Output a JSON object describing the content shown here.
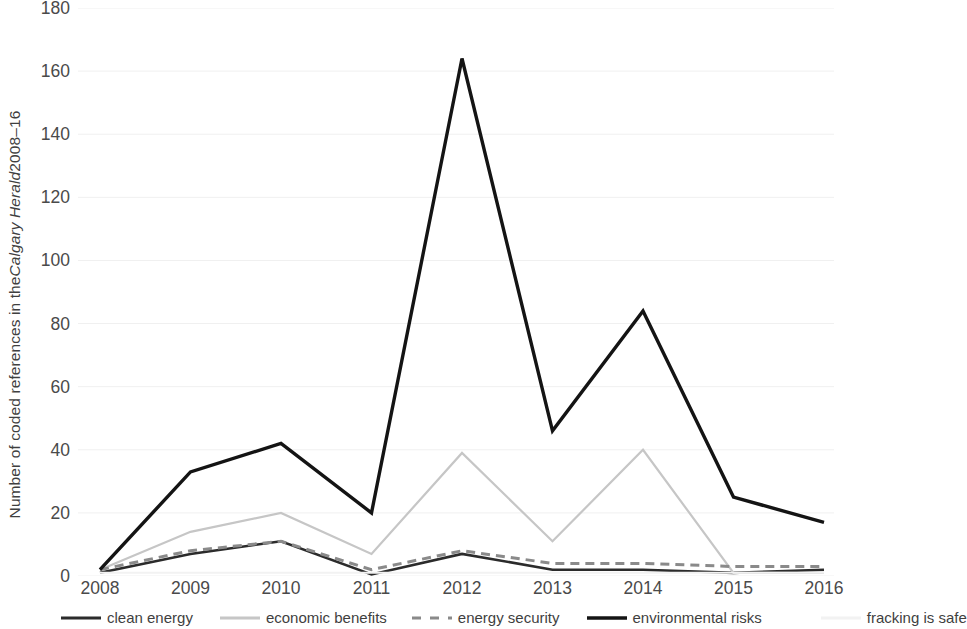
{
  "chart_data": {
    "type": "line",
    "title": "",
    "xlabel": "",
    "ylabel": "Number of coded references in the Calgary Herald 2008–16",
    "ylabel_parts": {
      "before": "Number of coded references in the ",
      "italic": "Calgary Herald",
      "after": " 2008–16"
    },
    "categories": [
      "2008",
      "2009",
      "2010",
      "2011",
      "2012",
      "2013",
      "2014",
      "2015",
      "2016"
    ],
    "x": [
      2008,
      2009,
      2010,
      2011,
      2012,
      2013,
      2014,
      2015,
      2016
    ],
    "ylim": [
      0,
      180
    ],
    "yticks": [
      0,
      20,
      40,
      60,
      80,
      100,
      120,
      140,
      160,
      180
    ],
    "grid": true,
    "grid_axis": "y",
    "legend_position": "bottom",
    "series": [
      {
        "name": "clean energy",
        "color": "#2b2b2b",
        "style": "solid",
        "width": 2.6,
        "values": [
          1,
          7,
          11,
          0.5,
          7,
          2,
          2,
          1,
          2
        ]
      },
      {
        "name": "economic benefits",
        "color": "#c6c6c6",
        "style": "solid",
        "width": 2.2,
        "values": [
          2,
          14,
          20,
          7,
          39,
          11,
          40,
          1,
          1
        ]
      },
      {
        "name": "energy security",
        "color": "#8a8a8a",
        "style": "dashed",
        "width": 3.0,
        "values": [
          2,
          8,
          11,
          2,
          8,
          4,
          4,
          3,
          3
        ]
      },
      {
        "name": "environmental risks",
        "color": "#141414",
        "style": "solid",
        "width": 3.4,
        "values": [
          2,
          33,
          42,
          20,
          164,
          46,
          84,
          25,
          17
        ]
      },
      {
        "name": "fracking is safe",
        "color": "#f2f2f2",
        "style": "solid",
        "width": 2.0,
        "values": [
          1,
          1,
          1,
          1,
          1,
          1,
          1,
          1,
          1
        ]
      }
    ]
  },
  "axis": {
    "y_tick_labels": [
      "180",
      "160",
      "140",
      "120",
      "100",
      "80",
      "60",
      "40",
      "20",
      "0"
    ],
    "x_tick_labels": [
      "2008",
      "2009",
      "2010",
      "2011",
      "2012",
      "2013",
      "2014",
      "2015",
      "2016"
    ]
  },
  "legend": {
    "items": [
      {
        "label": "clean energy",
        "icon": "line-swatch-solid-dark-icon"
      },
      {
        "label": "economic benefits",
        "icon": "line-swatch-solid-light-icon"
      },
      {
        "label": "energy security",
        "icon": "line-swatch-dashed-gray-icon"
      },
      {
        "label": "environmental risks",
        "icon": "line-swatch-solid-black-icon"
      },
      {
        "label": "fracking is safe",
        "icon": "line-swatch-solid-faint-icon"
      }
    ]
  }
}
